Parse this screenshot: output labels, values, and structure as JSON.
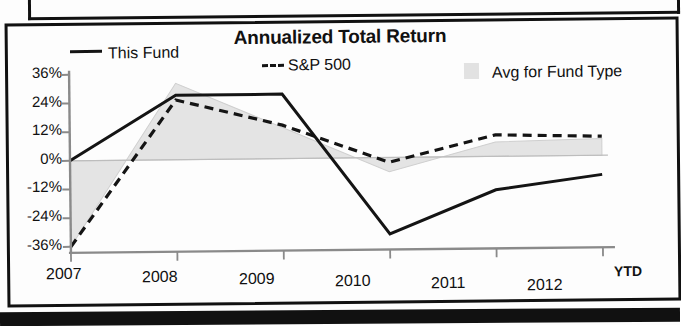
{
  "chart_data": {
    "type": "line",
    "title": "Annualized Total Return",
    "xlabel": "",
    "ylabel": "",
    "categories": [
      "2007",
      "2008",
      "2009",
      "2010",
      "2011",
      "2012"
    ],
    "x_tick_suffix": "YTD",
    "ytick_labels": [
      "36%",
      "24%",
      "12%",
      "0%",
      "-12%",
      "-24%",
      "-36%"
    ],
    "ytick_values": [
      36,
      24,
      12,
      0,
      -12,
      -24,
      -36
    ],
    "ylim": [
      -36,
      36
    ],
    "grid": false,
    "legend_position": "top",
    "series": [
      {
        "name": "This Fund",
        "style": "solid",
        "color": "#141414",
        "values": [
          0,
          27,
          27,
          -32,
          -14,
          -8
        ]
      },
      {
        "name": "S&P 500",
        "style": "dashed",
        "color": "#141414",
        "values": [
          -36,
          25,
          14,
          -2,
          9,
          8
        ]
      },
      {
        "name": "Avg for Fund Type",
        "style": "area",
        "color": "#e4e4e4",
        "values": [
          -36,
          32,
          13,
          -6,
          6,
          7
        ]
      }
    ],
    "zero_line": 0
  },
  "chart": {
    "title": "Annualized Total Return",
    "legend": [
      {
        "label": "This Fund",
        "marker": "solid-line"
      },
      {
        "label": "S&P 500",
        "marker": "dashed-line"
      },
      {
        "label": "Avg for Fund Type",
        "marker": "area-swatch"
      }
    ],
    "y_axis": {
      "ticks": [
        "36%",
        "24%",
        "12%",
        "0%",
        "-12%",
        "-24%",
        "-36%"
      ]
    },
    "x_axis": {
      "ticks": [
        "2007",
        "2008",
        "2009",
        "2010",
        "2011",
        "2012"
      ],
      "suffix": "YTD"
    }
  }
}
